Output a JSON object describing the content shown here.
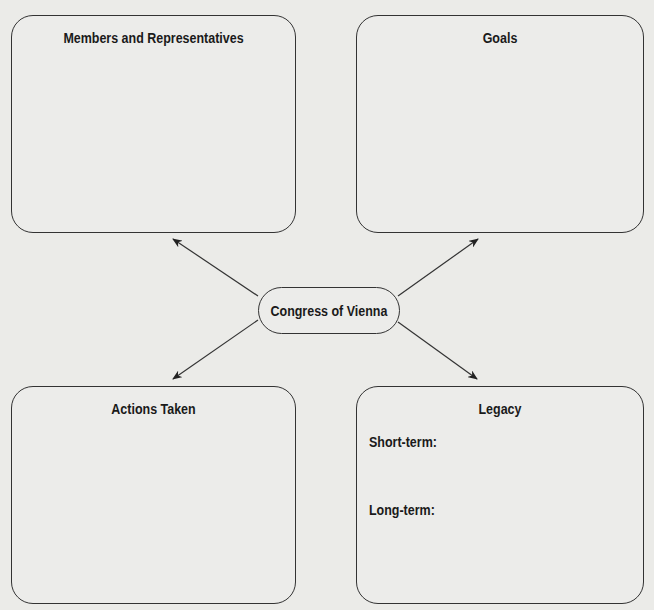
{
  "diagram": {
    "center": {
      "label": "Congress of Vienna"
    },
    "boxes": [
      {
        "id": "members",
        "title": "Members and Representatives"
      },
      {
        "id": "goals",
        "title": "Goals"
      },
      {
        "id": "actions",
        "title": "Actions Taken"
      },
      {
        "id": "legacy",
        "title": "Legacy",
        "sublabels": [
          "Short-term:",
          "Long-term:"
        ]
      }
    ],
    "colors": {
      "background": "#ebebe8",
      "line": "#333333",
      "text": "#1a1a1a"
    }
  }
}
